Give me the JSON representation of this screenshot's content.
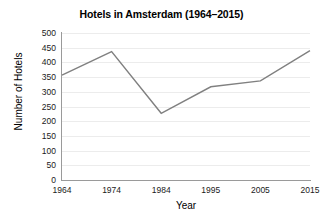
{
  "chart_data": {
    "type": "line",
    "title": "Hotels in Amsterdam (1964–2015)",
    "xlabel": "Year",
    "ylabel": "Number of Hotels",
    "categories": [
      "1964",
      "1974",
      "1984",
      "1995",
      "2005",
      "2015"
    ],
    "values": [
      357,
      437,
      227,
      317,
      337,
      440
    ],
    "series": [
      {
        "name": "Number of Hotels",
        "values": [
          357,
          437,
          227,
          317,
          337,
          440
        ]
      }
    ],
    "ylim": [
      0,
      500
    ],
    "yticks": [
      "0",
      "50",
      "100",
      "150",
      "200",
      "250",
      "300",
      "350",
      "400",
      "450",
      "500"
    ],
    "ytick_values": [
      0,
      50,
      100,
      150,
      200,
      250,
      300,
      350,
      400,
      450,
      500
    ],
    "grid": true,
    "grid_axis": "y",
    "legend": false,
    "legend_position": "none",
    "line_color": "#808080",
    "grid_color": "#ececec",
    "axis_color": "#9a9a9a",
    "text_color": "#1a1a1a",
    "background_color": "#ffffff",
    "markers": false,
    "line_width": 1.4
  }
}
